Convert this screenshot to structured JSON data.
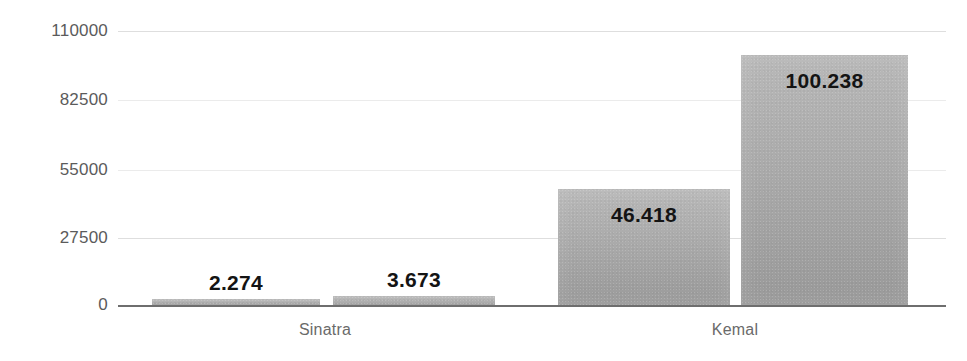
{
  "chart_data": {
    "type": "bar",
    "title": "",
    "subtitle": "",
    "xlabel": "",
    "ylabel": "",
    "categories": [
      "Sinatra",
      "Kemal"
    ],
    "ylim": [
      0,
      110000
    ],
    "ytick_labels": [
      "110000",
      "82500",
      "55000",
      "27500",
      "0"
    ],
    "ytick_values": [
      110000,
      82500,
      55000,
      27500,
      0
    ],
    "grid": true,
    "legend": "none",
    "bars": [
      {
        "group": "Sinatra",
        "label": "2.274",
        "value": 2274,
        "x_center_pct": 24.6
      },
      {
        "group": "Sinatra",
        "label": "3.673",
        "value": 3673,
        "x_center_pct": 41.4
      },
      {
        "group": "Kemal",
        "label": "46.418",
        "value": 46418,
        "x_center_pct": 66.6
      },
      {
        "group": "Kemal",
        "label": "100.238",
        "value": 100238,
        "x_center_pct": 85.2
      }
    ],
    "series": [
      {
        "name": "bar-1",
        "values": [
          2274,
          46418
        ]
      },
      {
        "name": "bar-2",
        "values": [
          3673,
          100238
        ]
      }
    ],
    "colors": {
      "bar_fill": "#ababab",
      "axis_line": "#6e6e6e",
      "gridline": "#dfdfdf",
      "tick_text": "#5b5b5b",
      "category_text": "#6a6a6a",
      "value_text": "#141414",
      "background": "#ffffff"
    }
  },
  "axis": {
    "yticks": [
      {
        "label": "110000"
      },
      {
        "label": "82500"
      },
      {
        "label": "55000"
      },
      {
        "label": "27500"
      },
      {
        "label": "0"
      }
    ],
    "categories": [
      {
        "label": "Sinatra"
      },
      {
        "label": "Kemal"
      }
    ]
  },
  "values": {
    "bar1": "2.274",
    "bar2": "3.673",
    "bar3": "46.418",
    "bar4": "100.238"
  }
}
